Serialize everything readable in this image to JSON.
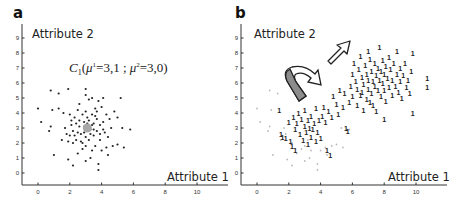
{
  "chart_data": [
    {
      "panel": "a",
      "type": "scatter",
      "title": "",
      "xlabel": "Attribute 1",
      "ylabel": "Attribute 2",
      "xlim": [
        -1,
        11.5
      ],
      "ylim": [
        -0.8,
        9.6
      ],
      "xticks": [
        0,
        2,
        4,
        6,
        8,
        10
      ],
      "yticks": [
        0,
        1,
        2,
        3,
        4,
        5,
        6,
        7,
        8,
        9
      ],
      "grid": false,
      "annotation": {
        "text_main": "C",
        "sub": "1",
        "text": "C1(μ1=3,1 ; μ2=3,0)",
        "mu1": 3.1,
        "mu2": 3.0,
        "x": 3.1,
        "y": 7.0
      },
      "centroid": {
        "x": 3.1,
        "y": 3.0,
        "color": "#a8a8a8"
      },
      "series": [
        {
          "name": "cluster C1 points",
          "marker": "dot",
          "color": "#222222",
          "points": [
            [
              0,
              4.3
            ],
            [
              0.2,
              3.4
            ],
            [
              0.8,
              5.5
            ],
            [
              0.9,
              4.2
            ],
            [
              1.3,
              5.3
            ],
            [
              1.3,
              4.3
            ],
            [
              1.5,
              2.2
            ],
            [
              1,
              1.2
            ],
            [
              0.8,
              3.1
            ],
            [
              0.7,
              2.8
            ],
            [
              1.6,
              4
            ],
            [
              1.7,
              3
            ],
            [
              1.9,
              5.6
            ],
            [
              1.9,
              0.9
            ],
            [
              2.2,
              0.5
            ],
            [
              2,
              2.5
            ],
            [
              2.1,
              3.5
            ],
            [
              2.2,
              2.8
            ],
            [
              2.3,
              3.7
            ],
            [
              2.4,
              2.2
            ],
            [
              2.5,
              4.2
            ],
            [
              2.5,
              1.3
            ],
            [
              2.6,
              3.1
            ],
            [
              2.7,
              2.6
            ],
            [
              2.8,
              3.9
            ],
            [
              2.8,
              2
            ],
            [
              2.9,
              3.4
            ],
            [
              3,
              5.6
            ],
            [
              3,
              5.2
            ],
            [
              3,
              4.1
            ],
            [
              3,
              2.4
            ],
            [
              3,
              1.8
            ],
            [
              3,
              0.8
            ],
            [
              3.1,
              3.7
            ],
            [
              3.2,
              2.2
            ],
            [
              3.2,
              4.9
            ],
            [
              3.3,
              2.9
            ],
            [
              3.3,
              1
            ],
            [
              3.4,
              3.9
            ],
            [
              3.4,
              5
            ],
            [
              3.5,
              3.3
            ],
            [
              3.5,
              2.5
            ],
            [
              3.6,
              4.3
            ],
            [
              3.6,
              1.8
            ],
            [
              3.7,
              3.6
            ],
            [
              3.7,
              2.8
            ],
            [
              3.8,
              4.8
            ],
            [
              3.8,
              0.6
            ],
            [
              3.8,
              0.2
            ],
            [
              3.9,
              3.2
            ],
            [
              3.9,
              2.2
            ],
            [
              4,
              4.4
            ],
            [
              4,
              1.5
            ],
            [
              4.1,
              5
            ],
            [
              4.1,
              3.4
            ],
            [
              4.2,
              2.7
            ],
            [
              4.3,
              1.7
            ],
            [
              4.3,
              3.9
            ],
            [
              4.4,
              2.4
            ],
            [
              4.5,
              3.6
            ],
            [
              4.6,
              3
            ],
            [
              4.7,
              1.8
            ],
            [
              4.8,
              4.1
            ],
            [
              5,
              3.7
            ],
            [
              5,
              1.9
            ],
            [
              5.2,
              5
            ],
            [
              5.3,
              3
            ],
            [
              5.4,
              1.7
            ],
            [
              5.8,
              2.9
            ],
            [
              2.1,
              3.2
            ],
            [
              2.3,
              2.5
            ],
            [
              2.6,
              3.5
            ],
            [
              2.7,
              2.1
            ],
            [
              2.9,
              2.7
            ],
            [
              3.1,
              3.3
            ],
            [
              3.3,
              2.6
            ],
            [
              3.4,
              3.2
            ],
            [
              3.5,
              2.9
            ],
            [
              3.6,
              3.8
            ],
            [
              3.2,
              3.5
            ],
            [
              2.9,
              3.1
            ],
            [
              2.5,
              2.7
            ],
            [
              2.4,
              3.3
            ],
            [
              3.9,
              2.6
            ],
            [
              4.1,
              2.9
            ],
            [
              2.8,
              1.6
            ],
            [
              2.2,
              2
            ],
            [
              2,
              3.9
            ],
            [
              1.8,
              2.6
            ],
            [
              3.7,
              4.1
            ],
            [
              3.4,
              1.5
            ],
            [
              4.4,
              1.2
            ],
            [
              2.6,
              4.6
            ],
            [
              1.9,
              2.1
            ]
          ]
        }
      ]
    },
    {
      "panel": "b",
      "type": "scatter",
      "title": "",
      "xlabel": "Attribute 1",
      "ylabel": "Attribute 2",
      "xlim": [
        -1,
        11.5
      ],
      "ylim": [
        -0.8,
        9.6
      ],
      "xticks": [
        0,
        2,
        4,
        6,
        8,
        10
      ],
      "yticks": [
        0,
        1,
        2,
        3,
        4,
        5,
        6,
        7,
        8,
        9
      ],
      "grid": false,
      "arrows": [
        {
          "name": "curved-arrow",
          "description": "grey curved arrow from low cluster toward right",
          "x": 2.5,
          "y": 5.8
        },
        {
          "name": "straight-arrow",
          "description": "outlined arrow pointing up-right toward shifted cluster",
          "from": [
            4.3,
            7.5
          ],
          "to": [
            5.8,
            9.0
          ]
        }
      ],
      "series": [
        {
          "name": "original points (faded)",
          "marker": "dot",
          "color": "#bbbbbb",
          "points": [
            [
              0,
              4.3
            ],
            [
              0.2,
              3.4
            ],
            [
              0.8,
              5.5
            ],
            [
              0.9,
              4.2
            ],
            [
              1.3,
              5.3
            ],
            [
              1,
              1.2
            ],
            [
              0.8,
              3.1
            ],
            [
              0.7,
              2.8
            ],
            [
              1.9,
              0.9
            ],
            [
              2.2,
              0.5
            ],
            [
              3,
              0.8
            ],
            [
              3.8,
              0.2
            ],
            [
              3.8,
              0.6
            ],
            [
              3.3,
              1
            ],
            [
              4.4,
              1.2
            ],
            [
              5.4,
              1.7
            ],
            [
              5.8,
              2.9
            ],
            [
              5.3,
              3
            ],
            [
              2.5,
              1.3
            ],
            [
              1.7,
              3
            ],
            [
              2.8,
              1.6
            ],
            [
              3.4,
              1.5
            ],
            [
              4.7,
              1.8
            ],
            [
              5,
              1.9
            ],
            [
              4.3,
              1.7
            ],
            [
              3,
              1.8
            ],
            [
              1.5,
              2.2
            ],
            [
              2.2,
              2
            ],
            [
              4,
              1.5
            ],
            [
              3.2,
              2.2
            ],
            [
              1.8,
              2.6
            ]
          ]
        },
        {
          "name": "class '1' labeled points",
          "marker": "1",
          "color": "#222222",
          "points": [
            [
              1.4,
              4.2
            ],
            [
              1.5,
              2.6
            ],
            [
              1.6,
              2.4
            ],
            [
              1.8,
              2.3
            ],
            [
              2,
              3.4
            ],
            [
              2.1,
              2.1
            ],
            [
              2.2,
              1.8
            ],
            [
              2.3,
              3.7
            ],
            [
              2.4,
              2.9
            ],
            [
              2.4,
              1.5
            ],
            [
              2.5,
              3.3
            ],
            [
              2.6,
              4
            ],
            [
              2.7,
              2.6
            ],
            [
              2.8,
              3.6
            ],
            [
              2.9,
              2.2
            ],
            [
              3,
              3.1
            ],
            [
              3,
              4.2
            ],
            [
              3.1,
              2.7
            ],
            [
              3.2,
              3.5
            ],
            [
              3.2,
              1.9
            ],
            [
              3.3,
              3
            ],
            [
              3.4,
              2.4
            ],
            [
              3.4,
              3.8
            ],
            [
              3.5,
              2.9
            ],
            [
              3.6,
              3.3
            ],
            [
              3.7,
              2.1
            ],
            [
              3.7,
              4.3
            ],
            [
              3.8,
              2.7
            ],
            [
              3.9,
              3.5
            ],
            [
              4,
              2.3
            ],
            [
              4.1,
              3.8
            ],
            [
              4.2,
              4.4
            ],
            [
              4.3,
              3.4
            ],
            [
              4.4,
              1.5
            ],
            [
              4.6,
              1.2
            ],
            [
              4.5,
              4.1
            ],
            [
              4.7,
              3.7
            ],
            [
              4.8,
              5.1
            ],
            [
              5,
              4.6
            ],
            [
              5.1,
              3.9
            ],
            [
              5.2,
              5.5
            ],
            [
              5.4,
              4.4
            ],
            [
              5.5,
              5.3
            ],
            [
              5.6,
              3
            ],
            [
              5.7,
              2.8
            ],
            [
              5.8,
              4.7
            ],
            [
              5.9,
              5.8
            ],
            [
              6,
              6.6
            ],
            [
              6,
              5.1
            ],
            [
              6.1,
              7.3
            ],
            [
              6.2,
              6.1
            ],
            [
              6.3,
              4.5
            ],
            [
              6.3,
              5.6
            ],
            [
              6.4,
              6.9
            ],
            [
              6.5,
              5.2
            ],
            [
              6.5,
              7.8
            ],
            [
              6.6,
              6.4
            ],
            [
              6.7,
              4.2
            ],
            [
              6.7,
              5.9
            ],
            [
              6.8,
              7.2
            ],
            [
              6.9,
              6.6
            ],
            [
              6.9,
              4.9
            ],
            [
              7,
              5.6
            ],
            [
              7,
              6.2
            ],
            [
              7,
              8.1
            ],
            [
              7.1,
              7.6
            ],
            [
              7.2,
              5.3
            ],
            [
              7.2,
              6.8
            ],
            [
              7.3,
              4.5
            ],
            [
              7.3,
              6.1
            ],
            [
              7.4,
              7.3
            ],
            [
              7.4,
              5.8
            ],
            [
              7.5,
              6.5
            ],
            [
              7.5,
              4.1
            ],
            [
              7.6,
              7
            ],
            [
              7.6,
              5.5
            ],
            [
              7.7,
              8.4
            ],
            [
              7.7,
              6.2
            ],
            [
              7.8,
              6.8
            ],
            [
              7.8,
              5.1
            ],
            [
              7.9,
              7.5
            ],
            [
              7.9,
              6
            ],
            [
              8,
              5.5
            ],
            [
              8,
              6.6
            ],
            [
              8,
              3.6
            ],
            [
              8.1,
              7.1
            ],
            [
              8.1,
              4.8
            ],
            [
              8.2,
              6.3
            ],
            [
              8.3,
              5.7
            ],
            [
              8.3,
              7.7
            ],
            [
              8.4,
              6.9
            ],
            [
              8.5,
              5.2
            ],
            [
              8.5,
              6.2
            ],
            [
              8.6,
              7.3
            ],
            [
              8.7,
              5.8
            ],
            [
              8.8,
              6.6
            ],
            [
              8.9,
              5.4
            ],
            [
              9,
              7
            ],
            [
              9,
              6.1
            ],
            [
              9.1,
              5
            ],
            [
              9.2,
              6.5
            ],
            [
              9.3,
              7.3
            ],
            [
              9.4,
              5.7
            ],
            [
              9.5,
              6.2
            ],
            [
              9.6,
              5.3
            ],
            [
              9.7,
              6.8
            ],
            [
              9.8,
              8
            ],
            [
              9.8,
              4
            ],
            [
              10.7,
              6.3
            ],
            [
              10.7,
              5.7
            ],
            [
              8.8,
              8.1
            ],
            [
              6.6,
              5.4
            ],
            [
              7.1,
              4.7
            ]
          ]
        }
      ]
    }
  ],
  "panels": {
    "a": {
      "letter": "a",
      "ylabel": "Attribute 2",
      "xlabel": "Attribute 1",
      "annotation": {
        "C": "C",
        "sub": "1",
        "open": "(",
        "mu": "μ",
        "sup1": "1",
        "eq1": "=3,1 ; ",
        "sup2": "2",
        "eq2": "=3,0)"
      }
    },
    "b": {
      "letter": "b",
      "ylabel": "Attribute 2",
      "xlabel": "Attribute 1"
    }
  },
  "ticks": {
    "x": [
      "0",
      "2",
      "4",
      "6",
      "8",
      "10"
    ],
    "y": [
      "0",
      "1",
      "2",
      "3",
      "4",
      "5",
      "6",
      "7",
      "8",
      "9"
    ]
  }
}
